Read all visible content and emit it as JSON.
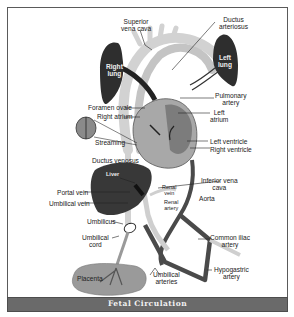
{
  "figure": {
    "caption": "Fetal Circulation",
    "colors": {
      "frame": "#5a5a5a",
      "caption_bar": "#6a6a6a",
      "caption_text": "#f2f2f2",
      "lung": "#2e2e2e",
      "liver": "#383838",
      "vessel_light": "#cfcfcf",
      "vessel_dark": "#4a4a4a",
      "heart": "#a8a8a8",
      "placenta": "#9a9a9a"
    }
  },
  "labels": {
    "superior_vena_cava": [
      "Superior",
      "vena cava"
    ],
    "ductus_arteriosus": [
      "Ductus",
      "arteriosus"
    ],
    "right_lung": [
      "Right",
      "lung"
    ],
    "left_lung": [
      "Left",
      "lung"
    ],
    "pulmonary_artery": [
      "Pulmonary",
      "artery"
    ],
    "foramen_ovale": "Foramen ovale",
    "right_atrium": "Right atrium",
    "left_atrium": [
      "Left",
      "atrium"
    ],
    "streaming": "Streaming",
    "left_ventricle": "Left ventricle",
    "right_ventricle": "Right ventricle",
    "ductus_venosus": "Ductus venosus",
    "liver": "Liver",
    "inferior_vena_cava": [
      "Inferior vena",
      "cava"
    ],
    "renal_vein": [
      "Renal",
      "vein"
    ],
    "portal_vein": "Portal vein",
    "aorta": "Aorta",
    "umbilical_vein": "Umbilical vein",
    "renal_artery": [
      "Renal",
      "artery"
    ],
    "umbilicus": "Umbilicus",
    "umbilical_cord": [
      "Umbilical",
      "cord"
    ],
    "common_iliac_artery": [
      "Common iliac",
      "artery"
    ],
    "placenta": "Placenta",
    "umbilical_arteries": [
      "Umbilical",
      "arteries"
    ],
    "hypogastric_artery": [
      "Hypogastric",
      "artery"
    ]
  }
}
